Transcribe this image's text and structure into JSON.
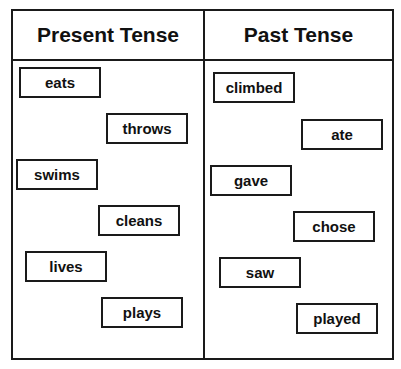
{
  "columns": [
    {
      "title": "Present Tense",
      "words": [
        "eats",
        "throws",
        "swims",
        "cleans",
        "lives",
        "plays"
      ]
    },
    {
      "title": "Past Tense",
      "words": [
        "climbed",
        "ate",
        "gave",
        "chose",
        "saw",
        "played"
      ]
    }
  ],
  "colors": {
    "border": "#1a1a1a",
    "background": "#ffffff",
    "text": "#111111"
  }
}
